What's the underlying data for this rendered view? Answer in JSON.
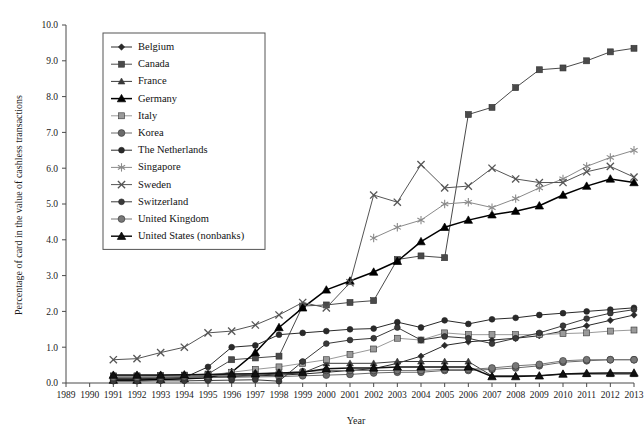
{
  "chart_data": {
    "type": "line",
    "title": "",
    "xlabel": "Year",
    "ylabel": "Percentage of card in the value of cashless transactions",
    "xlim": [
      1989,
      2013
    ],
    "ylim": [
      0.0,
      10.0
    ],
    "grid": false,
    "legend_position": "upper-left-inside",
    "x": [
      1989,
      1990,
      1991,
      1992,
      1993,
      1994,
      1995,
      1996,
      1997,
      1998,
      1999,
      2000,
      2001,
      2002,
      2003,
      2004,
      2005,
      2006,
      2007,
      2008,
      2009,
      2010,
      2011,
      2012,
      2013
    ],
    "xtick_labels": [
      "1989",
      "1990",
      "1991",
      "1992",
      "1993",
      "1994",
      "1995",
      "1996",
      "1997",
      "1998",
      "1999",
      "2000",
      "2001",
      "2002",
      "2003",
      "2004",
      "2005",
      "2006",
      "2007",
      "2008",
      "2009",
      "2010",
      "2011",
      "2012",
      "2013"
    ],
    "ytick_labels": [
      "0.0",
      "1.0",
      "2.0",
      "3.0",
      "4.0",
      "5.0",
      "6.0",
      "7.0",
      "8.0",
      "9.0",
      "10.0"
    ],
    "ytick_values": [
      0.0,
      1.0,
      2.0,
      3.0,
      4.0,
      5.0,
      6.0,
      7.0,
      8.0,
      9.0,
      10.0
    ],
    "series": [
      {
        "name": "Belgium",
        "marker": "diamond",
        "color": "#2a2a2a",
        "values": [
          null,
          null,
          0.1,
          0.1,
          0.1,
          0.12,
          0.15,
          0.18,
          0.2,
          0.22,
          0.25,
          0.3,
          0.35,
          0.4,
          0.55,
          0.75,
          1.05,
          1.15,
          1.2,
          1.25,
          1.32,
          1.45,
          1.6,
          1.75,
          1.9
        ]
      },
      {
        "name": "Canada",
        "marker": "square",
        "color": "#4a4a4a",
        "values": [
          null,
          null,
          0.2,
          0.2,
          0.21,
          0.22,
          0.25,
          0.65,
          0.7,
          0.75,
          2.15,
          2.18,
          2.25,
          2.3,
          3.45,
          3.55,
          3.5,
          7.5,
          7.7,
          8.25,
          8.75,
          8.8,
          9.0,
          9.25,
          9.35
        ]
      },
      {
        "name": "France",
        "marker": "triangle",
        "color": "#3a3a3a",
        "values": [
          null,
          null,
          0.15,
          0.15,
          0.16,
          0.17,
          0.18,
          0.2,
          0.22,
          0.25,
          0.28,
          0.55,
          0.55,
          0.55,
          0.6,
          0.6,
          0.6,
          0.6,
          0.2,
          0.2,
          0.2,
          0.25,
          0.25,
          0.25,
          0.25
        ]
      },
      {
        "name": "Germany",
        "marker": "triangle-bold",
        "color": "#000000",
        "values": [
          null,
          null,
          0.08,
          0.08,
          0.1,
          0.12,
          0.15,
          0.3,
          0.85,
          1.55,
          2.1,
          2.6,
          2.85,
          3.1,
          3.4,
          3.95,
          4.35,
          4.55,
          4.7,
          4.8,
          4.95,
          5.25,
          5.5,
          5.7,
          5.6
        ]
      },
      {
        "name": "Italy",
        "marker": "square-light",
        "color": "#9a9a9a",
        "values": [
          null,
          null,
          0.18,
          0.18,
          0.19,
          0.2,
          0.22,
          0.3,
          0.38,
          0.45,
          0.55,
          0.65,
          0.8,
          0.95,
          1.25,
          1.2,
          1.4,
          1.35,
          1.35,
          1.35,
          1.35,
          1.38,
          1.4,
          1.45,
          1.48
        ]
      },
      {
        "name": "Korea",
        "marker": "circle-mid",
        "color": "#6a6a6a",
        "values": [
          null,
          null,
          0.14,
          0.14,
          0.14,
          0.15,
          0.15,
          0.16,
          0.17,
          0.18,
          0.2,
          0.22,
          0.24,
          0.28,
          0.3,
          0.3,
          0.35,
          0.35,
          0.38,
          0.42,
          0.48,
          0.58,
          0.62,
          0.65,
          0.65
        ]
      },
      {
        "name": "The Netherlands",
        "marker": "circle-dark",
        "color": "#2a2a2a",
        "values": [
          null,
          null,
          0.12,
          0.12,
          0.13,
          0.15,
          0.45,
          1.0,
          1.05,
          1.35,
          1.4,
          1.45,
          1.5,
          1.52,
          1.7,
          1.55,
          1.75,
          1.65,
          1.78,
          1.82,
          1.9,
          1.95,
          2.0,
          2.05,
          2.1
        ]
      },
      {
        "name": "Singapore",
        "marker": "asterisk",
        "color": "#8a8a8a",
        "values": [
          null,
          null,
          null,
          null,
          null,
          null,
          null,
          null,
          null,
          null,
          null,
          null,
          null,
          4.05,
          4.35,
          4.55,
          5.0,
          5.05,
          4.9,
          5.15,
          5.45,
          5.7,
          6.05,
          6.3,
          6.5
        ]
      },
      {
        "name": "Sweden",
        "marker": "x-cross",
        "color": "#555555",
        "values": [
          null,
          null,
          0.65,
          0.68,
          0.85,
          1.0,
          1.4,
          1.45,
          1.62,
          1.9,
          2.25,
          2.1,
          2.8,
          5.25,
          5.05,
          6.1,
          5.45,
          5.5,
          6.0,
          5.7,
          5.6,
          5.6,
          5.9,
          6.05,
          5.75
        ]
      },
      {
        "name": "Switzerland",
        "marker": "circle-small",
        "color": "#3a3a3a",
        "values": [
          null,
          null,
          0.05,
          0.05,
          0.06,
          0.06,
          0.07,
          0.08,
          0.09,
          0.05,
          0.6,
          1.1,
          1.2,
          1.25,
          1.55,
          1.2,
          1.3,
          1.25,
          1.1,
          1.25,
          1.4,
          1.6,
          1.8,
          1.95,
          2.05
        ]
      },
      {
        "name": "United Kingdom",
        "marker": "circle-grey",
        "color": "#777777",
        "values": [
          null,
          null,
          0.16,
          0.16,
          0.17,
          0.18,
          0.2,
          0.22,
          0.25,
          0.28,
          0.32,
          0.35,
          0.35,
          0.35,
          0.35,
          0.35,
          0.38,
          0.38,
          0.42,
          0.48,
          0.52,
          0.62,
          0.65,
          0.65,
          0.65
        ]
      },
      {
        "name": "United States (nonbanks)",
        "marker": "triangle-bold",
        "color": "#111111",
        "values": [
          null,
          null,
          0.22,
          0.22,
          0.22,
          0.23,
          0.24,
          0.25,
          0.26,
          0.28,
          0.3,
          0.4,
          0.42,
          0.42,
          0.45,
          0.45,
          0.45,
          0.45,
          0.18,
          0.18,
          0.2,
          0.25,
          0.27,
          0.28,
          0.28
        ]
      }
    ]
  },
  "legend": {
    "entries": [
      {
        "label": "Belgium"
      },
      {
        "label": "Canada"
      },
      {
        "label": "France"
      },
      {
        "label": "Germany"
      },
      {
        "label": "Italy"
      },
      {
        "label": "Korea"
      },
      {
        "label": "The Netherlands"
      },
      {
        "label": "Singapore"
      },
      {
        "label": "Sweden"
      },
      {
        "label": "Switzerland"
      },
      {
        "label": "United Kingdom"
      },
      {
        "label": "United States (nonbanks)"
      }
    ]
  }
}
